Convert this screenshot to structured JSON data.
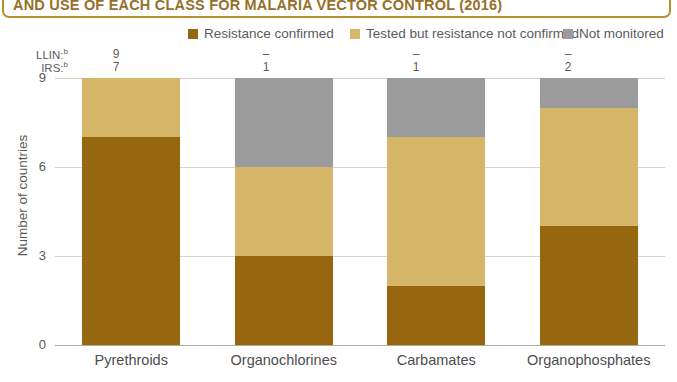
{
  "title": {
    "text": "AND USE OF EACH CLASS FOR MALARIA VECTOR CONTROL (2016)",
    "border_color": "#b8912f",
    "text_color": "#96702a"
  },
  "legend": {
    "items": [
      {
        "label": "Resistance confirmed",
        "color": "#96670f"
      },
      {
        "label": "Tested but resistance not confirmed",
        "color": "#d6b769"
      },
      {
        "label": "Not monitored",
        "color": "#9b9b9b"
      }
    ]
  },
  "annotations": {
    "rows": [
      {
        "key": "LLIN:",
        "sup": "b",
        "values": [
          "9",
          "–",
          "–",
          "–"
        ]
      },
      {
        "key": "IRS:",
        "sup": "b",
        "values": [
          "7",
          "1",
          "1",
          "2"
        ]
      }
    ]
  },
  "axes": {
    "ylabel": "Number of countries",
    "yticks": [
      "0",
      "3",
      "6",
      "9"
    ]
  },
  "chart_data": {
    "type": "bar",
    "title": "AND USE OF EACH CLASS FOR MALARIA VECTOR CONTROL (2016)",
    "xlabel": "",
    "ylabel": "Number of countries",
    "ylim": [
      0,
      9
    ],
    "yticks": [
      0,
      3,
      6,
      9
    ],
    "grid": true,
    "stacked": true,
    "legend_position": "top",
    "categories": [
      "Pyrethroids",
      "Organochlorines",
      "Carbamates",
      "Organophosphates"
    ],
    "series": [
      {
        "name": "Resistance confirmed",
        "color": "#96670f",
        "values": [
          7,
          3,
          2,
          4
        ]
      },
      {
        "name": "Tested but resistance not confirmed",
        "color": "#d6b769",
        "values": [
          2,
          3,
          5,
          4
        ]
      },
      {
        "name": "Not monitored",
        "color": "#9b9b9b",
        "values": [
          0,
          3,
          2,
          1
        ]
      }
    ],
    "annotations": [
      {
        "name": "LLIN:b",
        "values": [
          "9",
          "–",
          "–",
          "–"
        ]
      },
      {
        "name": "IRS:b",
        "values": [
          "7",
          "1",
          "1",
          "2"
        ]
      }
    ]
  }
}
